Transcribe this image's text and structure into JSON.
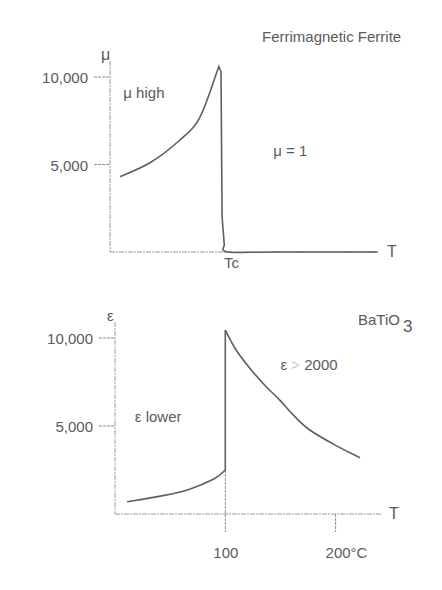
{
  "chart_data": [
    {
      "type": "line",
      "title": "Ferrimagnetic Ferrite",
      "xlabel": "T",
      "ylabel": "μ",
      "x_ticks": [
        {
          "value": 100,
          "label": "Tc"
        }
      ],
      "y_ticks": [
        {
          "value": 5000,
          "label": "5,000"
        },
        {
          "value": 10000,
          "label": "10,000"
        }
      ],
      "xlim": [
        0,
        242
      ],
      "ylim": [
        0,
        10000
      ],
      "grid": false,
      "annotations": [
        {
          "text": "μ high",
          "x": 12,
          "y": 8800
        },
        {
          "text": "μ  = 1",
          "x": 147,
          "y": 5500
        }
      ],
      "series": [
        {
          "name": "μ",
          "x": [
            9,
            36,
            63,
            81,
            98,
            100,
            101,
            103,
            106,
            150,
            241
          ],
          "y": [
            4300,
            5100,
            6400,
            7700,
            10600,
            10300,
            2000,
            400,
            1,
            1,
            1
          ]
        }
      ]
    },
    {
      "type": "line",
      "title": "BaTiO3",
      "title_main": "BaTiO",
      "title_sub": "3",
      "xlabel": "T",
      "ylabel": "ε",
      "x_ticks": [
        {
          "value": 100,
          "label": "100"
        },
        {
          "value": 200,
          "label": "200°C"
        }
      ],
      "y_ticks": [
        {
          "value": 5000,
          "label": "5,000"
        },
        {
          "value": 10000,
          "label": "10,000"
        }
      ],
      "xlim": [
        0,
        242
      ],
      "ylim": [
        0,
        10000
      ],
      "grid": false,
      "annotations": [
        {
          "text": "ε lower",
          "x": 18,
          "y": 5200
        },
        {
          "text_parts": [
            "ε ",
            "> ",
            "2000"
          ],
          "text": "ε > 2000",
          "x": 150,
          "y": 8200
        }
      ],
      "series": [
        {
          "name": "ε",
          "x": [
            11,
            40,
            67,
            90,
            100,
            100,
            110,
            122,
            136,
            149,
            162,
            176,
            200,
            222
          ],
          "y": [
            700,
            1000,
            1400,
            2000,
            2500,
            10450,
            9300,
            8300,
            7300,
            6500,
            5600,
            4800,
            3900,
            3200
          ]
        }
      ]
    }
  ]
}
